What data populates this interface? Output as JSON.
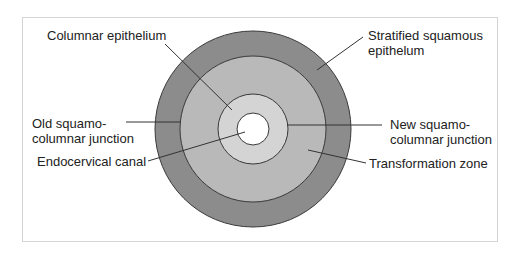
{
  "diagram": {
    "type": "concentric-rings",
    "colors": {
      "stratified_squamous": "#8c8c8c",
      "transformation_zone": "#b9b9b9",
      "columnar": "#d4d4d4",
      "canal": "#ffffff",
      "outline": "#3a3a3a",
      "leader": "#333333",
      "frame": "#d4d4d4"
    },
    "rings": [
      {
        "name": "stratified-squamous-ring",
        "r": 98
      },
      {
        "name": "transformation-zone-ring",
        "r": 73
      },
      {
        "name": "columnar-ring",
        "r": 35
      },
      {
        "name": "endocervical-canal",
        "r": 16
      }
    ],
    "labels": {
      "columnar": "Columnar epithelium",
      "stratified": "Stratified squamous\nepithelum",
      "old_scj": "Old squamo-\ncolumnar junction",
      "canal": "Endocervical canal",
      "new_scj": "New squamo-\ncolumnar junction",
      "tz": "Transformation zone"
    }
  }
}
